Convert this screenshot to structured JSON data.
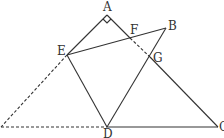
{
  "diagram": {
    "type": "geometry",
    "points": {
      "A": {
        "label": "A",
        "x": 107,
        "y": 15
      },
      "B": {
        "label": "B",
        "x": 166,
        "y": 28
      },
      "C": {
        "label": "C",
        "x": 218,
        "y": 127
      },
      "D": {
        "label": "D",
        "x": 107,
        "y": 127
      },
      "E": {
        "label": "E",
        "x": 67,
        "y": 55
      },
      "F": {
        "label": "F",
        "x": 130,
        "y": 38
      },
      "G": {
        "label": "G",
        "x": 150,
        "y": 57
      }
    },
    "solid_segments": [
      [
        "A",
        "E"
      ],
      [
        "A",
        "F"
      ],
      [
        "G",
        "C"
      ],
      [
        "E",
        "B"
      ],
      [
        "B",
        "D"
      ],
      [
        "E",
        "D"
      ],
      [
        "D",
        "C"
      ]
    ],
    "dashed_segments": [
      [
        "F",
        "G"
      ],
      [
        "E",
        "P"
      ],
      [
        "P",
        "D"
      ]
    ],
    "extra_points": {
      "P": {
        "x": 1,
        "y": 127
      }
    },
    "right_angle_at": "A",
    "stroke_color": "#333333"
  }
}
